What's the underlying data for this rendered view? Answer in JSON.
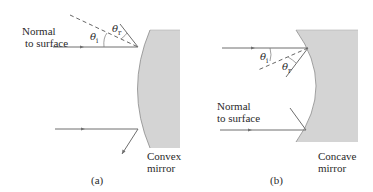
{
  "figure": {
    "panels": [
      {
        "id": "a",
        "caption": "(a)",
        "normal_label_line1": "Normal",
        "normal_label_line2": "to surface",
        "mirror_label_line1": "Convex",
        "mirror_label_line2": "mirror",
        "theta_i": "θ",
        "theta_i_sub": "i",
        "theta_r": "θ",
        "theta_r_sub": "r"
      },
      {
        "id": "b",
        "caption": "(b)",
        "normal_label_line1": "Normal",
        "normal_label_line2": "to surface",
        "mirror_label_line1": "Concave",
        "mirror_label_line2": "mirror",
        "theta_i": "θ",
        "theta_i_sub": "i",
        "theta_r": "θ",
        "theta_r_sub": "r"
      }
    ],
    "colors": {
      "mirror_fill": "#d4d4d4",
      "mirror_edge": "#8a8a8a",
      "ray": "#6e6e6e",
      "text": "#2a2a2a"
    }
  }
}
